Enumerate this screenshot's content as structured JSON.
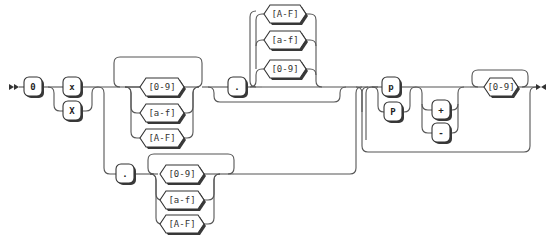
{
  "diagram": {
    "type": "railroad",
    "terminals": {
      "zero": "0",
      "x_lower": "x",
      "x_upper": "X",
      "dot_int": ".",
      "dot_frac": ".",
      "p_lower": "p",
      "p_upper": "P",
      "plus": "+",
      "minus": "-"
    },
    "char_classes": {
      "int_digits": [
        "[0-9]",
        "[a-f]",
        "[A-F]"
      ],
      "frac_digits": [
        "[A-F]",
        "[a-f]",
        "[0-9]"
      ],
      "lower_frac_digits": [
        "[0-9]",
        "[a-f]",
        "[A-F]"
      ],
      "exp_digits": "[0-9]"
    },
    "colors": {
      "line": "#555555",
      "box_border": "#333333",
      "box_shadow": "#3a3a3a",
      "background": "#ffffff"
    }
  }
}
